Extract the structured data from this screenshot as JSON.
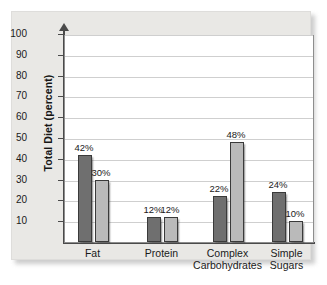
{
  "chart_data": {
    "type": "bar",
    "title": "",
    "xlabel": "",
    "ylabel": "Total Diet (percent)",
    "ylim": [
      0,
      100
    ],
    "yticks": [
      10,
      20,
      30,
      40,
      50,
      60,
      70,
      80,
      90,
      100
    ],
    "ytick_labels": [
      "10",
      "20",
      "30",
      "40",
      "50",
      "60",
      "70",
      "80",
      "90",
      "100"
    ],
    "grid": "horizontal",
    "legend": "none",
    "categories": [
      "Fat",
      "Protein",
      "Complex\nCarbohydrates",
      "Simple\nSugars"
    ],
    "series": [
      {
        "name": "series-1",
        "color": "#6f6f6f",
        "values": [
          42,
          12,
          22,
          24
        ]
      },
      {
        "name": "series-2",
        "color": "#bababa",
        "values": [
          30,
          12,
          48,
          10
        ]
      }
    ],
    "bars": [
      {
        "category": "Fat",
        "series": "series-1",
        "value": 42,
        "label": "42%"
      },
      {
        "category": "Fat",
        "series": "series-2",
        "value": 30,
        "label": "30%"
      },
      {
        "category": "Protein",
        "series": "series-1",
        "value": 12,
        "label": "12%"
      },
      {
        "category": "Protein",
        "series": "series-2",
        "value": 12,
        "label": "12%"
      },
      {
        "category": "Complex Carbohydrates",
        "series": "series-1",
        "value": 22,
        "label": "22%"
      },
      {
        "category": "Complex Carbohydrates",
        "series": "series-2",
        "value": 48,
        "label": "48%"
      },
      {
        "category": "Simple Sugars",
        "series": "series-1",
        "value": 24,
        "label": "24%"
      },
      {
        "category": "Simple Sugars",
        "series": "series-2",
        "value": 10,
        "label": "10%"
      }
    ],
    "category_labels": [
      {
        "line1": "Fat",
        "line2": ""
      },
      {
        "line1": "Protein",
        "line2": ""
      },
      {
        "line1": "Complex",
        "line2": "Carbohydrates"
      },
      {
        "line1": "Simple",
        "line2": "Sugars"
      }
    ],
    "colors": {
      "series_dark": "#6f6f6f",
      "series_light": "#bababa",
      "panel_background": "#e9e8e5",
      "plot_background": "#ffffff",
      "axis": "#4a4a4a",
      "gridline": "#cfcfcf",
      "text": "#1a1a1a"
    }
  }
}
